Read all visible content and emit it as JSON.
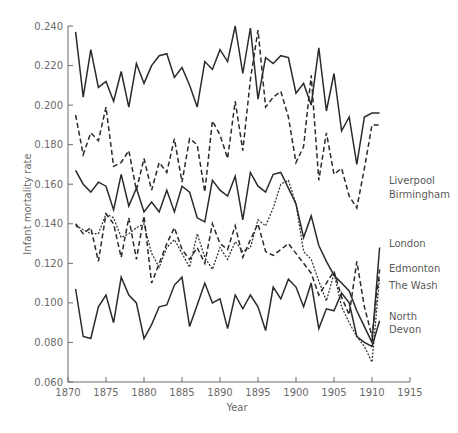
{
  "chart_data": {
    "type": "line",
    "title": "",
    "xlabel": "Year",
    "ylabel": "Infant mortality rate",
    "xlim": [
      1870,
      1915
    ],
    "ylim": [
      0.06,
      0.24
    ],
    "grid": false,
    "legend_position": "inline-right",
    "x_ticks": [
      "1870",
      "1875",
      "1880",
      "1885",
      "1890",
      "1895",
      "1900",
      "1905",
      "1910",
      "1915"
    ],
    "y_ticks": [
      "0.060",
      "0.080",
      "0.100",
      "0.120",
      "0.140",
      "0.160",
      "0.180",
      "0.200",
      "0.220",
      "0.240"
    ],
    "x": [
      1871,
      1872,
      1873,
      1874,
      1875,
      1876,
      1877,
      1878,
      1879,
      1880,
      1881,
      1882,
      1883,
      1884,
      1885,
      1886,
      1887,
      1888,
      1889,
      1890,
      1891,
      1892,
      1893,
      1894,
      1895,
      1896,
      1897,
      1898,
      1899,
      1900,
      1901,
      1902,
      1903,
      1904,
      1905,
      1906,
      1907,
      1908,
      1909,
      1910,
      1911
    ],
    "series": [
      {
        "name": "Liverpool",
        "style": "solid",
        "label_lines": [
          "Liverpool"
        ],
        "values": [
          0.237,
          0.204,
          0.228,
          0.209,
          0.212,
          0.202,
          0.217,
          0.199,
          0.221,
          0.211,
          0.22,
          0.225,
          0.226,
          0.214,
          0.219,
          0.21,
          0.199,
          0.222,
          0.218,
          0.228,
          0.222,
          0.24,
          0.216,
          0.239,
          0.203,
          0.224,
          0.221,
          0.225,
          0.224,
          0.206,
          0.211,
          0.2,
          0.229,
          0.197,
          0.216,
          0.187,
          0.194,
          0.17,
          0.194,
          0.196,
          0.196
        ]
      },
      {
        "name": "Birmingham",
        "style": "dashed",
        "label_lines": [
          "Birmingham"
        ],
        "values": [
          0.195,
          0.175,
          0.186,
          0.182,
          0.199,
          0.169,
          0.171,
          0.177,
          0.157,
          0.173,
          0.157,
          0.171,
          0.166,
          0.183,
          0.161,
          0.183,
          0.18,
          0.156,
          0.192,
          0.185,
          0.173,
          0.202,
          0.177,
          0.213,
          0.238,
          0.199,
          0.204,
          0.207,
          0.194,
          0.171,
          0.179,
          0.215,
          0.162,
          0.186,
          0.165,
          0.168,
          0.154,
          0.148,
          0.168,
          0.19,
          0.19
        ]
      },
      {
        "name": "London",
        "style": "solid",
        "label_lines": [
          "London"
        ],
        "values": [
          0.167,
          0.16,
          0.156,
          0.161,
          0.159,
          0.147,
          0.165,
          0.149,
          0.158,
          0.146,
          0.151,
          0.146,
          0.157,
          0.146,
          0.159,
          0.156,
          0.143,
          0.141,
          0.162,
          0.157,
          0.154,
          0.164,
          0.142,
          0.166,
          0.159,
          0.156,
          0.165,
          0.166,
          0.158,
          0.15,
          0.133,
          0.144,
          0.129,
          0.121,
          0.114,
          0.11,
          0.106,
          0.096,
          0.088,
          0.08,
          0.128
        ]
      },
      {
        "name": "Edmonton",
        "style": "dashed",
        "label_lines": [
          "Edmonton"
        ],
        "values": [
          0.14,
          0.135,
          0.138,
          0.121,
          0.145,
          0.14,
          0.123,
          0.143,
          0.122,
          0.144,
          0.11,
          0.12,
          0.13,
          0.138,
          0.127,
          0.122,
          0.128,
          0.12,
          0.14,
          0.13,
          0.127,
          0.139,
          0.123,
          0.132,
          0.14,
          0.126,
          0.124,
          0.127,
          0.13,
          0.125,
          0.12,
          0.115,
          0.104,
          0.11,
          0.116,
          0.103,
          0.094,
          0.121,
          0.098,
          0.083,
          0.117
        ]
      },
      {
        "name": "The Wash",
        "style": "dotted",
        "label_lines": [
          "The Wash"
        ],
        "values": [
          0.139,
          0.137,
          0.135,
          0.135,
          0.145,
          0.143,
          0.133,
          0.135,
          0.138,
          0.14,
          0.125,
          0.118,
          0.128,
          0.132,
          0.125,
          0.118,
          0.135,
          0.123,
          0.117,
          0.128,
          0.122,
          0.131,
          0.126,
          0.128,
          0.142,
          0.139,
          0.148,
          0.16,
          0.162,
          0.15,
          0.126,
          0.122,
          0.111,
          0.101,
          0.115,
          0.098,
          0.09,
          0.083,
          0.078,
          0.07,
          0.113
        ]
      },
      {
        "name": "North Devon",
        "style": "solid",
        "label_lines": [
          "North",
          "Devon"
        ],
        "values": [
          0.107,
          0.083,
          0.082,
          0.098,
          0.104,
          0.09,
          0.113,
          0.104,
          0.1,
          0.082,
          0.089,
          0.098,
          0.099,
          0.109,
          0.113,
          0.088,
          0.099,
          0.11,
          0.1,
          0.102,
          0.087,
          0.104,
          0.097,
          0.104,
          0.098,
          0.086,
          0.108,
          0.102,
          0.112,
          0.108,
          0.098,
          0.11,
          0.087,
          0.097,
          0.096,
          0.105,
          0.1,
          0.083,
          0.08,
          0.078,
          0.091
        ]
      }
    ]
  },
  "labels": {
    "x_axis_title": "Year",
    "y_axis_title": "Infant mortality rate"
  }
}
